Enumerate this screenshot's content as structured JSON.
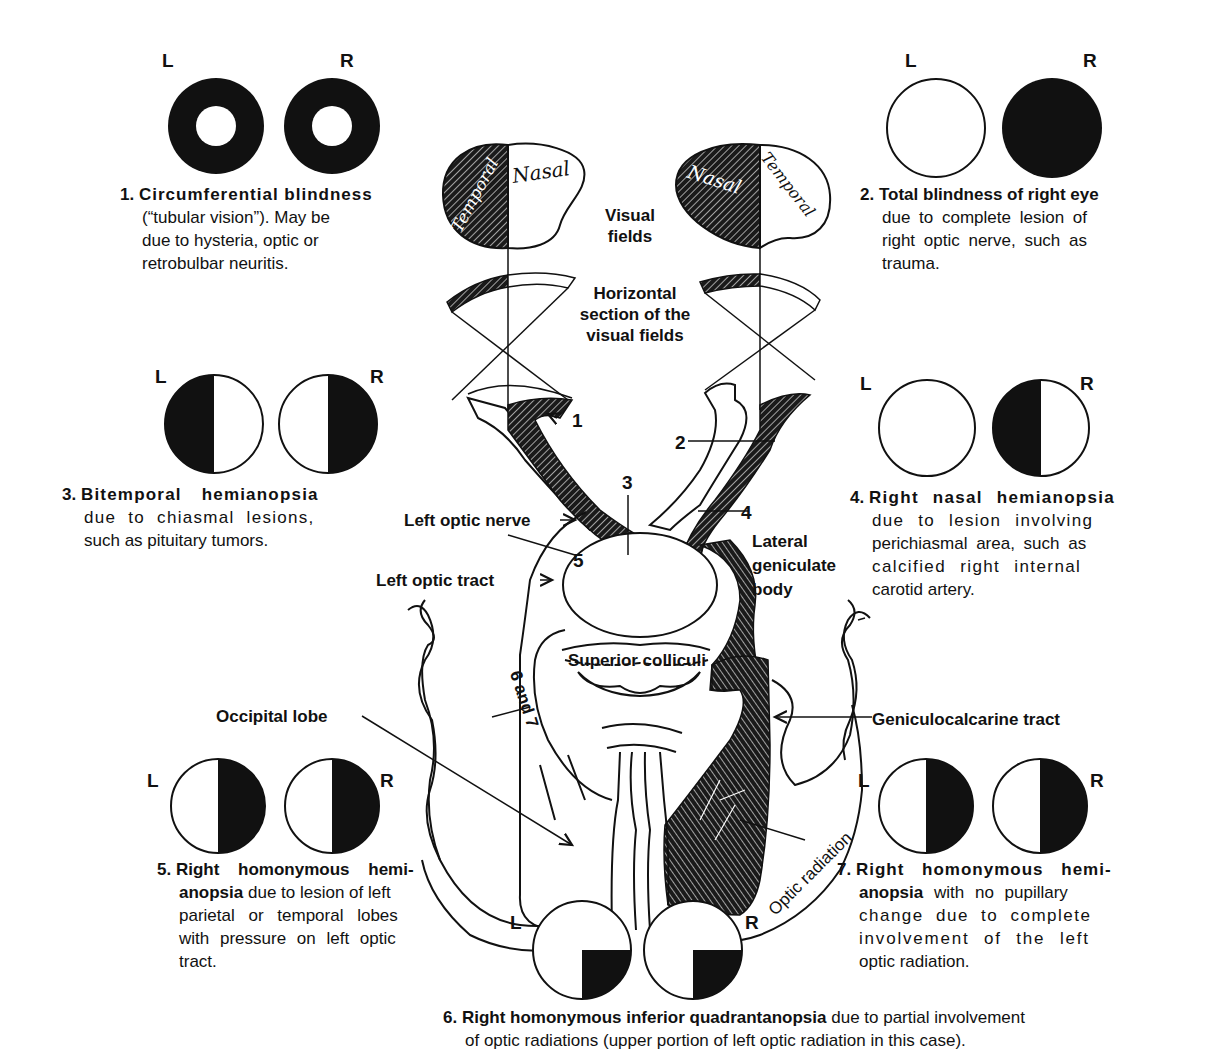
{
  "figure": {
    "eye_labels": {
      "left": "L",
      "right": "R"
    }
  },
  "center_labels": {
    "visual_fields": "Visual\nfields",
    "visual_fields_l1": "Visual",
    "visual_fields_l2": "fields",
    "horizontal_l1": "Horizontal",
    "horizontal_l2": "section of the",
    "horizontal_l3": "visual fields",
    "left_eye_temporal": "Temporal",
    "left_eye_nasal": "Nasal",
    "right_eye_nasal": "Nasal",
    "right_eye_temporal": "Temporal",
    "left_optic_nerve": "Left optic nerve",
    "left_optic_tract": "Left optic tract",
    "lateral_geniculate_l1": "Lateral",
    "lateral_geniculate_l2": "geniculate",
    "lateral_geniculate_l3": "body",
    "superior_colliculi": "Superior colliculi",
    "occipital_lobe": "Occipital lobe",
    "geniculocalcarine_tract": "Geniculocalcarine tract",
    "optic_radiation": "Optic radiation",
    "six_and_seven": "6 and 7",
    "markers": [
      "1",
      "2",
      "3",
      "4",
      "5"
    ]
  },
  "lesions": [
    {
      "number": "1.",
      "title": "Circumferential blindness",
      "lines": [
        "(“tubular vision”). May be",
        "due to hysteria, optic or",
        "retrobulbar neuritis."
      ],
      "left_field": "ring",
      "right_field": "ring"
    },
    {
      "number": "2.",
      "title": "Total blindness of right eye",
      "lines": [
        "due to complete lesion of",
        "right optic nerve, such as",
        "trauma."
      ],
      "left_field": "clear",
      "right_field": "full"
    },
    {
      "number": "3.",
      "title": "Bitemporal hemianopsia",
      "lines": [
        "due to chiasmal lesions,",
        "such as pituitary tumors."
      ],
      "left_field": "left-half",
      "right_field": "right-half"
    },
    {
      "number": "4.",
      "title": "Right nasal hemianopsia",
      "lines": [
        "due to lesion involving",
        "perichiasmal area, such as",
        "calcified right internal",
        "carotid artery."
      ],
      "left_field": "clear",
      "right_field": "left-half"
    },
    {
      "number": "5.",
      "title": "Right homonymous hemi-",
      "title2": "anopsia",
      "lines": [
        " due to lesion of left",
        "parietal or temporal lobes",
        "with pressure on left optic",
        "tract."
      ],
      "left_field": "right-half",
      "right_field": "right-half"
    },
    {
      "number": "6.",
      "title": "Right homonymous inferior quadrantanopsia",
      "lines": [
        " due to partial involvement",
        "of optic radiations (upper portion of left optic radiation in this case)."
      ],
      "left_field": "lower-right-quadrant",
      "right_field": "lower-right-quadrant"
    },
    {
      "number": "7.",
      "title": "Right homonymous hemi-",
      "title2": "anopsia",
      "lines": [
        " with no pupillary",
        "change due to complete",
        "involvement of the left",
        "optic radiation."
      ],
      "left_field": "right-half",
      "right_field": "right-half"
    }
  ],
  "colors": {
    "ink": "#111111",
    "paper": "#ffffff"
  }
}
